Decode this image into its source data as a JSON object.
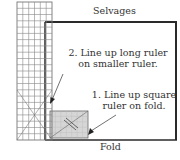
{
  "diagram": {
    "labels": {
      "top_edge": "Selvages",
      "bottom_edge": "Fold",
      "step2_line1": "2. Line up long ruler",
      "step2_line2": "on smaller ruler.",
      "step1_line1": "1. Line up square",
      "step1_line2": "ruler on fold."
    },
    "colors": {
      "fabric_border": "#2a2a2a",
      "ruler_grid": "#777777",
      "square_ruler_fill": "#d6d6d6",
      "text": "#333333"
    },
    "long_ruler": {
      "columns": 6,
      "rows": 22
    },
    "square_ruler": {
      "columns": 7,
      "rows": 5
    }
  }
}
